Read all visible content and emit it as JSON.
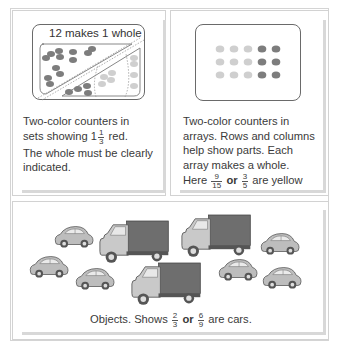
{
  "panels": {
    "sets": {
      "box_title": "12 makes 1 whole",
      "caption_line1": "Two-color counters in",
      "caption_line2_prefix": "sets showing",
      "mixed_whole": "1",
      "mixed_num": "1",
      "mixed_den": "3",
      "caption_line2_suffix": "red.",
      "caption_line3": "The whole must be clearly",
      "caption_line4": "indicated."
    },
    "arrays": {
      "caption_line1": "Two-color counters in",
      "caption_line2": "arrays. Rows and columns",
      "caption_line3": "help show parts. Each",
      "caption_line4": "array makes a whole.",
      "caption_line5_prefix": "Here",
      "frac1_num": "9",
      "frac1_den": "15",
      "or_word": "or",
      "frac2_num": "3",
      "frac2_den": "5",
      "caption_line5_suffix": "are yellow",
      "grid": {
        "rows": 3,
        "light_cols": 3,
        "dark_cols": 2
      }
    },
    "objects": {
      "caption_prefix": "Objects. Shows",
      "frac1_num": "2",
      "frac1_den": "3",
      "or_word": "or",
      "frac2_num": "6",
      "frac2_den": "9",
      "caption_suffix": "are cars.",
      "counts": {
        "cars": 6,
        "trucks": 3
      }
    }
  },
  "colors": {
    "dark_counter": "#7d7d7d",
    "light_counter": "#cfcfcf",
    "border": "#6a6a6a",
    "shadow": "#d8d8d8",
    "truck_box": "#6e6e6e",
    "truck_cab": "#c9c9c9",
    "car_body": "#bdbdbd"
  }
}
